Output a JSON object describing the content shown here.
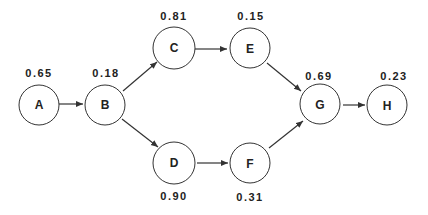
{
  "diagram": {
    "type": "directed-graph",
    "nodes": [
      {
        "id": "A",
        "label": "A",
        "value": "0.65"
      },
      {
        "id": "B",
        "label": "B",
        "value": "0.18"
      },
      {
        "id": "C",
        "label": "C",
        "value": "0.81"
      },
      {
        "id": "D",
        "label": "D",
        "value": "0.90"
      },
      {
        "id": "E",
        "label": "E",
        "value": "0.15"
      },
      {
        "id": "F",
        "label": "F",
        "value": "0.31"
      },
      {
        "id": "G",
        "label": "G",
        "value": "0.69"
      },
      {
        "id": "H",
        "label": "H",
        "value": "0.23"
      }
    ],
    "edges": [
      {
        "from": "A",
        "to": "B"
      },
      {
        "from": "B",
        "to": "C"
      },
      {
        "from": "B",
        "to": "D"
      },
      {
        "from": "C",
        "to": "E"
      },
      {
        "from": "D",
        "to": "F"
      },
      {
        "from": "E",
        "to": "G"
      },
      {
        "from": "F",
        "to": "G"
      },
      {
        "from": "G",
        "to": "H"
      }
    ],
    "colors": {
      "stroke": "#333333",
      "text": "#222222",
      "background": "#ffffff"
    }
  }
}
